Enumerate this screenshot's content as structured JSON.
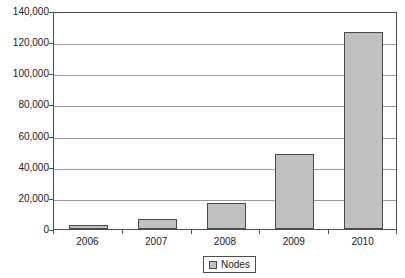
{
  "chart_data": {
    "type": "bar",
    "title": "",
    "subtitle": "",
    "xlabel": "",
    "ylabel": "",
    "categories": [
      "2006",
      "2007",
      "2008",
      "2009",
      "2010"
    ],
    "series": [
      {
        "name": "Nodes",
        "values": [
          2500,
          6500,
          17000,
          48000,
          126500
        ],
        "color": "#c0c0c0"
      }
    ],
    "ylim": [
      0,
      140000
    ],
    "ytick_values": [
      0,
      20000,
      40000,
      60000,
      80000,
      100000,
      120000,
      140000
    ],
    "ytick_labels": [
      "0",
      "20,000",
      "40,000",
      "60,000",
      "80,000",
      "100,000",
      "120,000",
      "140,000"
    ],
    "grid": true,
    "grid_axis": "y",
    "legend_position": "bottom-center",
    "legend_entries": [
      {
        "label": "Nodes",
        "swatch_color": "#c0c0c0"
      }
    ],
    "annotations": []
  },
  "style": {
    "plot_background": "#ffffff",
    "axis_color": "#4d4d4d",
    "gridline_color": "#9a9a9a",
    "bar_fill": "#c0c0c0",
    "bar_border": "#4a4a4a",
    "text_color": "#1a1a1a"
  }
}
